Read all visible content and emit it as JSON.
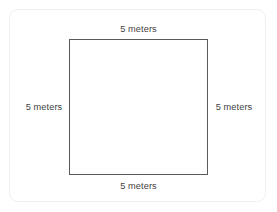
{
  "figure": {
    "shape_name": "square",
    "labels": {
      "top": "5 meters",
      "right": "5 meters",
      "bottom": "5 meters",
      "left": "5 meters"
    }
  },
  "colors": {
    "background": "#ffffff",
    "card_border": "#f0f0f0",
    "shape_stroke": "#5a5a5a",
    "label_text": "#3f3f3f"
  },
  "chart_data": {
    "type": "diagram",
    "shape": "square",
    "title": "",
    "sides": [
      {
        "position": "top",
        "label": "5 meters",
        "value": 5,
        "unit": "meters"
      },
      {
        "position": "right",
        "label": "5 meters",
        "value": 5,
        "unit": "meters"
      },
      {
        "position": "bottom",
        "label": "5 meters",
        "value": 5,
        "unit": "meters"
      },
      {
        "position": "left",
        "label": "5 meters",
        "value": 5,
        "unit": "meters"
      }
    ]
  }
}
